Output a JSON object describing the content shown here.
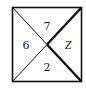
{
  "diagram": {
    "type": "square-divided-by-diagonals",
    "labels": {
      "top": "7",
      "left": "6",
      "right": "Z",
      "bottom": "2"
    },
    "colors": {
      "stroke": "#111111",
      "text": "#222222",
      "background": "#ffffff"
    }
  }
}
